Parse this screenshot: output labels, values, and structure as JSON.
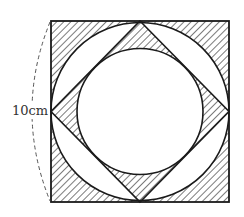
{
  "diagram": {
    "title": "",
    "dimension_label": "10cm",
    "shapes": {
      "square": {
        "x": 51,
        "y": 21,
        "width": 178,
        "height": 181,
        "side_label": "10cm"
      },
      "outer_circle": {
        "cx": 140,
        "cy": 111.5,
        "r": 89
      },
      "diamond": {
        "points": "140,21 229,111.5 140,202 51,111.5"
      },
      "inner_circle": {
        "cx": 140,
        "cy": 111.5,
        "r": 63
      }
    },
    "shaded_regions": [
      "square corners outside outer circle",
      "diamond corners outside inner circle"
    ],
    "colors": {
      "stroke": "#1a1a1a",
      "hatch": "#333333",
      "background": "#ffffff",
      "dash": "#555555"
    }
  }
}
